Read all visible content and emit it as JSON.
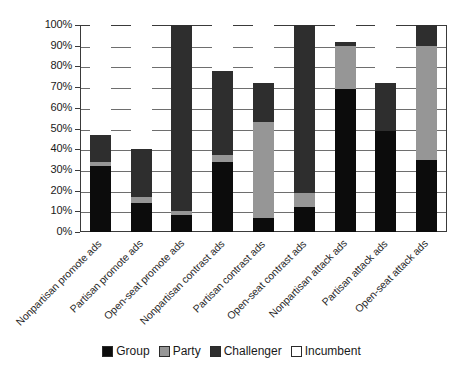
{
  "chart_data": {
    "type": "bar",
    "subtype": "stacked-100-percent",
    "title": "",
    "xlabel": "",
    "ylabel": "",
    "ylim": [
      0,
      100
    ],
    "ytick_labels": [
      "100%",
      "90%",
      "80%",
      "70%",
      "60%",
      "50%",
      "40%",
      "30%",
      "20%",
      "10%",
      "0%"
    ],
    "ytick_values": [
      100,
      90,
      80,
      70,
      60,
      50,
      40,
      30,
      20,
      10,
      0
    ],
    "grid": true,
    "legend_position": "bottom",
    "categories": [
      "Nonpartisan promote ads",
      "Partisan promote ads",
      "Open-seat promote ads",
      "Nonpartisan contrast ads",
      "Partisan contrast ads",
      "Open-seat contrast ads",
      "Nonpartisan attack ads",
      "Partisan attack ads",
      "Open-seat attack ads"
    ],
    "series": [
      {
        "name": "Group",
        "color": "#0c0c0c",
        "values": [
          32,
          14,
          8,
          34,
          7,
          12,
          69,
          49,
          35
        ]
      },
      {
        "name": "Party",
        "color": "#969696",
        "values": [
          2,
          3,
          2,
          3,
          46,
          7,
          21,
          0,
          55
        ]
      },
      {
        "name": "Challenger",
        "color": "#2e2e2e",
        "values": [
          13,
          23,
          90,
          41,
          19,
          81,
          2,
          23,
          10
        ]
      },
      {
        "name": "Incumbent",
        "color": "#ffffff",
        "values": [
          53,
          60,
          0,
          22,
          28,
          0,
          8,
          28,
          0
        ]
      }
    ]
  },
  "legend": {
    "items": [
      {
        "label": "Group",
        "color": "#0c0c0c"
      },
      {
        "label": "Party",
        "color": "#969696"
      },
      {
        "label": "Challenger",
        "color": "#2e2e2e"
      },
      {
        "label": "Incumbent",
        "color": "#ffffff"
      }
    ]
  }
}
